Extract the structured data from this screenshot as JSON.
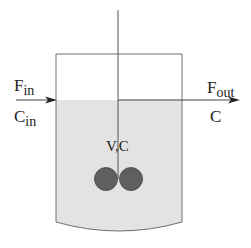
{
  "diagram": {
    "inlet": {
      "flow_label": "F",
      "flow_sub": "in",
      "conc_label": "C",
      "conc_sub": "in"
    },
    "outlet": {
      "flow_label": "F",
      "flow_sub": "out",
      "conc_label": "C"
    },
    "tank_label": "V,C",
    "icons": {
      "inlet_arrow": "arrow-right-icon",
      "outlet_arrow": "arrow-right-icon",
      "stirrer": "impeller-icon"
    },
    "colors": {
      "liquid": "#e3e3e3",
      "outline": "#6e6e6e",
      "impeller": "#5f5f5f",
      "text": "#222222"
    }
  }
}
